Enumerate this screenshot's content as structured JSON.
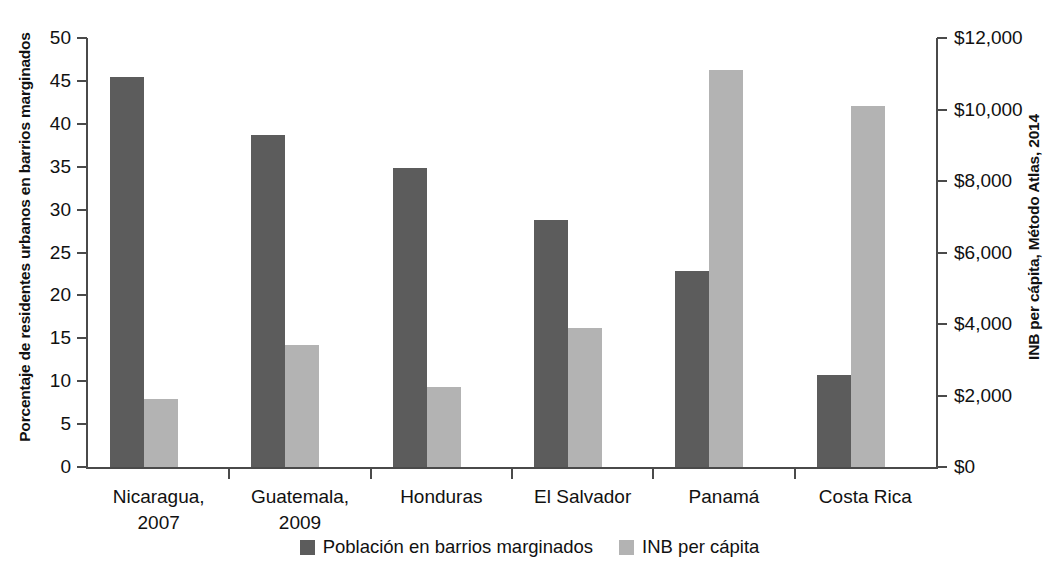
{
  "chart_data": {
    "type": "bar",
    "title": "",
    "subtitle": "",
    "categories": [
      "Nicaragua,\n2007",
      "Guatemala,\n2009",
      "Honduras",
      "El Salvador",
      "Panamá",
      "Costa Rica"
    ],
    "category_lines": [
      [
        "Nicaragua,",
        "2007"
      ],
      [
        "Guatemala,",
        "2009"
      ],
      [
        "Honduras",
        ""
      ],
      [
        "El Salvador",
        ""
      ],
      [
        "Panamá",
        ""
      ],
      [
        "Costa Rica",
        ""
      ]
    ],
    "series": [
      {
        "name": "Población en barrios marginados",
        "axis": "left",
        "color": "#5c5c5c",
        "values": [
          45.5,
          38.7,
          34.9,
          28.8,
          22.8,
          10.7
        ]
      },
      {
        "name": "INB per cápita",
        "axis": "right",
        "color": "#b3b3b3",
        "values": [
          1900,
          3400,
          2250,
          3900,
          11100,
          10100
        ]
      }
    ],
    "xlabel": "",
    "ylabel": "Porcentaje de residentes urbanos en barrios marginados",
    "y2label": "INB per cápita, Método Atlas, 2014",
    "ylim": [
      0,
      50
    ],
    "y2lim": [
      0,
      12000
    ],
    "yticks": [
      0,
      5,
      10,
      15,
      20,
      25,
      30,
      35,
      40,
      45,
      50
    ],
    "ytick_labels": [
      "0",
      "5",
      "10",
      "15",
      "20",
      "25",
      "30",
      "35",
      "40",
      "45",
      "50"
    ],
    "y2ticks": [
      0,
      2000,
      4000,
      6000,
      8000,
      10000,
      12000
    ],
    "y2tick_labels": [
      "$0",
      "$2,000",
      "$4,000",
      "$6,000",
      "$8,000",
      "$10,000",
      "$12,000"
    ],
    "grid": false,
    "legend_position": "bottom-center",
    "legend": [
      {
        "label": "Población en barrios marginados",
        "color": "#5c5c5c"
      },
      {
        "label": "INB per cápita",
        "color": "#b3b3b3"
      }
    ]
  }
}
